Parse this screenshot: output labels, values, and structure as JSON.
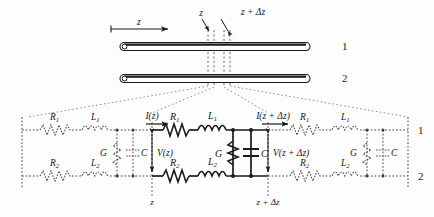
{
  "figure": {
    "colors": {
      "ink": "#1a1a1a",
      "faded": "#5c5c5c",
      "background": "#fdfdfd",
      "conductor_fill": "#ffffff"
    }
  },
  "top_diagram": {
    "conductor_1_label": "1",
    "conductor_2_label": "2",
    "axis_label": "z",
    "marker_z": "z",
    "marker_z_dz": "z + Δz"
  },
  "circuit": {
    "rail_1_label": "1",
    "rail_2_label": "2",
    "node_z_label": "z",
    "node_z_dz_label": "z + Δz",
    "current_in_label": "I(z)",
    "current_out_label": "I(z + Δz)",
    "voltage_in_label": "V(z)",
    "voltage_out_label": "V(z + Δz)",
    "cells": [
      {
        "name": "left-cell",
        "style": "dotted",
        "series_top": [
          {
            "symbol": "resistor",
            "label": "R",
            "sub": "1"
          },
          {
            "symbol": "inductor",
            "label": "L",
            "sub": "1"
          }
        ],
        "series_bottom": [
          {
            "symbol": "resistor",
            "label": "R",
            "sub": "2"
          },
          {
            "symbol": "inductor",
            "label": "L",
            "sub": "2"
          }
        ],
        "shunt": [
          {
            "symbol": "conductance",
            "label": "G"
          },
          {
            "symbol": "capacitor",
            "label": "C"
          }
        ]
      },
      {
        "name": "center-cell",
        "style": "solid",
        "series_top": [
          {
            "symbol": "resistor",
            "label": "R",
            "sub": "1"
          },
          {
            "symbol": "inductor",
            "label": "L",
            "sub": "1"
          }
        ],
        "series_bottom": [
          {
            "symbol": "resistor",
            "label": "R",
            "sub": "2"
          },
          {
            "symbol": "inductor",
            "label": "L",
            "sub": "2"
          }
        ],
        "shunt": [
          {
            "symbol": "conductance",
            "label": "G"
          },
          {
            "symbol": "capacitor",
            "label": "C"
          }
        ]
      },
      {
        "name": "right-cell",
        "style": "dotted",
        "series_top": [
          {
            "symbol": "resistor",
            "label": "R",
            "sub": "1"
          },
          {
            "symbol": "inductor",
            "label": "L",
            "sub": "1"
          }
        ],
        "series_bottom": [
          {
            "symbol": "resistor",
            "label": "R",
            "sub": "2"
          },
          {
            "symbol": "inductor",
            "label": "L",
            "sub": "2"
          }
        ],
        "shunt": [
          {
            "symbol": "conductance",
            "label": "G"
          },
          {
            "symbol": "capacitor",
            "label": "C"
          }
        ]
      }
    ]
  }
}
